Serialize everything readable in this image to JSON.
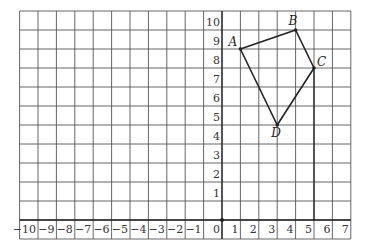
{
  "chart_data": {
    "type": "scatter",
    "title": "",
    "xlabel": "",
    "ylabel": "",
    "grid": true,
    "xlim": [
      -11,
      7
    ],
    "ylim": [
      -1,
      11
    ],
    "x_ticks": [
      -10,
      -9,
      -8,
      -7,
      -6,
      -5,
      -4,
      -3,
      -2,
      -1,
      0,
      1,
      2,
      3,
      4,
      5,
      6,
      7
    ],
    "y_ticks": [
      1,
      2,
      3,
      4,
      5,
      6,
      7,
      8,
      9,
      10
    ],
    "x_tick_labels": [
      "−10",
      "−9",
      "−8",
      "−7",
      "−6",
      "−5",
      "−4",
      "−3",
      "−2",
      "−1",
      "0",
      "1",
      "2",
      "3",
      "4",
      "5",
      "6",
      "7"
    ],
    "y_tick_labels": [
      "1",
      "2",
      "3",
      "4",
      "5",
      "6",
      "7",
      "8",
      "9",
      "10"
    ],
    "points": [
      {
        "label": "A",
        "x": 1,
        "y": 9
      },
      {
        "label": "B",
        "x": 4,
        "y": 10
      },
      {
        "label": "C",
        "x": 5,
        "y": 8
      },
      {
        "label": "D",
        "x": 3,
        "y": 5
      }
    ],
    "polygon": [
      "A",
      "B",
      "C",
      "D"
    ],
    "annotations": [
      {
        "type": "vertical-segment",
        "x": 5,
        "from_y": 0,
        "to_y": 8
      },
      {
        "type": "origin-dot",
        "x": 0,
        "y": 0
      }
    ]
  },
  "colors": {
    "grid": "#555555",
    "axis": "#222222",
    "shape": "#222222"
  }
}
